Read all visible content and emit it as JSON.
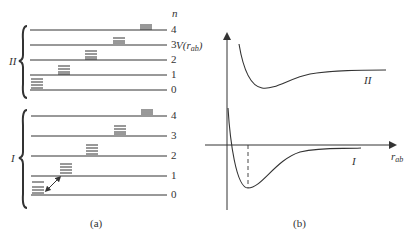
{
  "panel_a": {
    "caption": "(a)",
    "n_label": "n",
    "groups": [
      {
        "name": "II",
        "levels": [
          "4",
          "3",
          "2",
          "1",
          "0"
        ]
      },
      {
        "name": "I",
        "levels": [
          "4",
          "3",
          "2",
          "1",
          "0"
        ]
      }
    ]
  },
  "panel_b": {
    "caption": "(b)",
    "y_label_main": "V(r",
    "y_label_sub": "ab",
    "y_label_close": ")",
    "x_label_main": "r",
    "x_label_sub": "ab",
    "curve_labels": [
      "II",
      "I"
    ]
  },
  "colors": {
    "line": "#333333",
    "background": "#ffffff"
  }
}
